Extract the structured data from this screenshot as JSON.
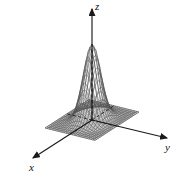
{
  "figure": {
    "kind": "3d-surface-wireframe-plot",
    "background_color": "#ffffff",
    "mesh_color": "#4a4a4a",
    "axis_color": "#1a1a1a",
    "width": 180,
    "height": 178
  },
  "axes": {
    "z": {
      "label": "z",
      "direction": "up"
    },
    "y": {
      "label": "y",
      "direction": "right-down"
    },
    "x": {
      "label": "x",
      "direction": "left-down"
    }
  },
  "chart_data": {
    "type": "surface",
    "title": "",
    "xlabel": "x",
    "ylabel": "y",
    "zlabel": "z",
    "function": "gaussian bell",
    "grid": true,
    "legend": "none",
    "xlim": [
      -3,
      3
    ],
    "ylim": [
      -3,
      3
    ],
    "zlim": [
      0,
      1
    ],
    "peak": {
      "x": 0,
      "y": 0,
      "z": 1
    },
    "grid_steps": 24
  }
}
